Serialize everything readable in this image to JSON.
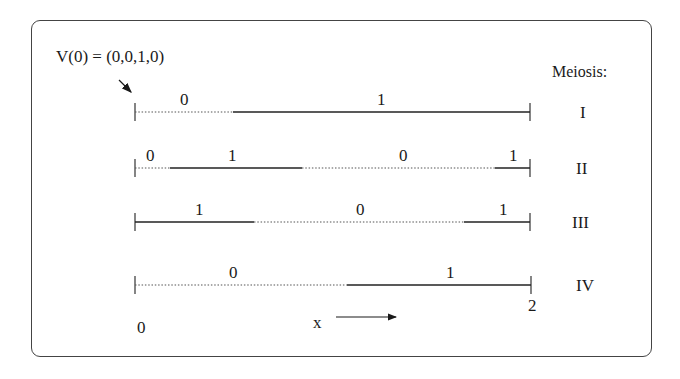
{
  "diagram": {
    "initial_vector_label": "V(0) = (0,0,1,0)",
    "meiosis_header": "Meiosis:",
    "axis": {
      "start_label": "0",
      "end_label": "2",
      "variable_label": "x"
    },
    "legend_style": {
      "solid": "allele 1",
      "dotted": "allele 0"
    },
    "rows": [
      {
        "meiosis": "I",
        "y": 112,
        "segments": [
          {
            "from": 135,
            "to": 233,
            "value": "0",
            "style": "dotted",
            "label_x": 184
          },
          {
            "from": 233,
            "to": 530,
            "value": "1",
            "style": "solid",
            "label_x": 381
          }
        ]
      },
      {
        "meiosis": "II",
        "y": 168,
        "segments": [
          {
            "from": 135,
            "to": 170,
            "value": "0",
            "style": "dotted",
            "label_x": 150
          },
          {
            "from": 170,
            "to": 302,
            "value": "1",
            "style": "solid",
            "label_x": 232
          },
          {
            "from": 302,
            "to": 495,
            "value": "0",
            "style": "dotted",
            "label_x": 403
          },
          {
            "from": 495,
            "to": 530,
            "value": "1",
            "style": "solid",
            "label_x": 513
          }
        ]
      },
      {
        "meiosis": "III",
        "y": 222,
        "segments": [
          {
            "from": 135,
            "to": 254,
            "value": "1",
            "style": "solid",
            "label_x": 199
          },
          {
            "from": 254,
            "to": 464,
            "value": "0",
            "style": "dotted",
            "label_x": 360
          },
          {
            "from": 464,
            "to": 530,
            "value": "1",
            "style": "solid",
            "label_x": 503
          }
        ]
      },
      {
        "meiosis": "IV",
        "y": 285,
        "segments": [
          {
            "from": 135,
            "to": 347,
            "value": "0",
            "style": "dotted",
            "label_x": 233
          },
          {
            "from": 347,
            "to": 531,
            "value": "1",
            "style": "solid",
            "label_x": 450
          }
        ]
      }
    ]
  }
}
